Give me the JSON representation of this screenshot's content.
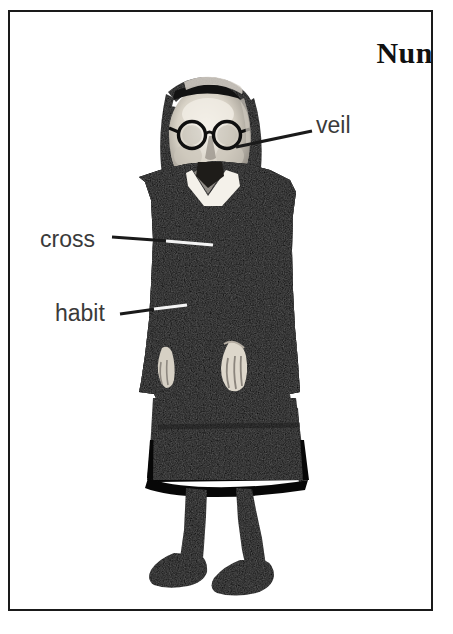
{
  "card": {
    "title": "Nun",
    "background_color": "#ffffff",
    "border_color": "#1a1a1a",
    "text_color": "#3a3a3a",
    "title_color": "#111111"
  },
  "illustration": {
    "name": "nun-photograph",
    "description": "High-contrast black-and-white photograph of a nun standing, wearing a dark habit with a white collar, a veil over her head, and round eyeglasses",
    "ink_color": "#0d0d0d",
    "highlight_color": "#f2efe9"
  },
  "callouts": [
    {
      "id": "veil",
      "label": "veil",
      "target": "head covering"
    },
    {
      "id": "cross",
      "label": "cross",
      "target": "chest"
    },
    {
      "id": "habit",
      "label": "habit",
      "target": "sleeve"
    }
  ],
  "leader_lines": {
    "color_on_white": "#1a1a1a",
    "color_on_black": "#f4f4f4"
  }
}
